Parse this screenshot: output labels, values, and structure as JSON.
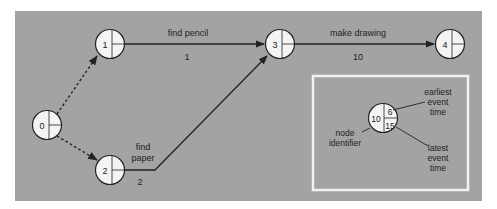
{
  "colors": {
    "background": "#ffffff",
    "panel": "#a3a3a3",
    "node_fill": "#f4f4f4",
    "line": "#222222",
    "legend_border": "#f2f2f2"
  },
  "nodes": [
    {
      "id": "0",
      "label": "0"
    },
    {
      "id": "1",
      "label": "1"
    },
    {
      "id": "2",
      "label": "2"
    },
    {
      "id": "3",
      "label": "3"
    },
    {
      "id": "4",
      "label": "4"
    }
  ],
  "activities": [
    {
      "from": "0",
      "to": "1",
      "type": "dummy",
      "name": "",
      "duration": ""
    },
    {
      "from": "0",
      "to": "2",
      "type": "dummy",
      "name": "",
      "duration": ""
    },
    {
      "from": "1",
      "to": "3",
      "type": "activity",
      "name": "find pencil",
      "duration": "1"
    },
    {
      "from": "2",
      "to": "3",
      "type": "activity",
      "name_line1": "find",
      "name_line2": "paper",
      "duration": "2"
    },
    {
      "from": "3",
      "to": "4",
      "type": "activity",
      "name": "make drawing",
      "duration": "10"
    }
  ],
  "legend": {
    "node_identifier_value": "10",
    "earliest_value": "6",
    "latest_value": "15",
    "earliest_label": [
      "earliest",
      "event",
      "time"
    ],
    "latest_label": [
      "latest",
      "event",
      "time"
    ],
    "identifier_label": [
      "node",
      "identifier"
    ]
  }
}
